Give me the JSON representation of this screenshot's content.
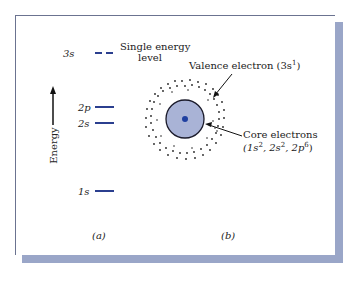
{
  "panel_a": {
    "axis_label": "Energy",
    "levels": [
      {
        "label": "3s",
        "style": "dashed",
        "note": "Single energy level"
      },
      {
        "label": "2p",
        "style": "solid"
      },
      {
        "label": "2s",
        "style": "solid"
      },
      {
        "label": "1s",
        "style": "solid"
      }
    ],
    "note_line1": "Single energy",
    "note_line2": "level",
    "caption": "(a)"
  },
  "panel_b": {
    "valence_label": "Valence electron (3s",
    "valence_sup": "1",
    "valence_close": ")",
    "core_label": "Core electrons",
    "core_config": [
      "(1s",
      "2",
      ", 2s",
      "2",
      ", 2p",
      "6",
      ")"
    ],
    "caption": "(b)"
  },
  "colors": {
    "level_line": "#2b3f8f",
    "core_fill": "#a9b3d6",
    "nucleus": "#1f3fa0",
    "shadow": "#9aa6c8"
  }
}
